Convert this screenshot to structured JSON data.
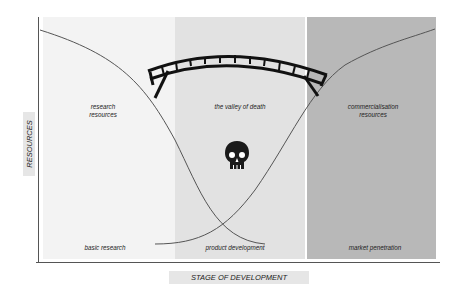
{
  "diagram": {
    "title": "Valley of death",
    "axes": {
      "x_label": "STAGE OF DEVELOPMENT",
      "y_label": "RESOURCES"
    },
    "panels": [
      {
        "name": "left",
        "top_label": "research\nresources",
        "top_label_lines": [
          "research",
          "resources"
        ],
        "bottom_label": "basic research",
        "color": "#f3f3f3"
      },
      {
        "name": "middle",
        "top_label": "the valley of death",
        "bottom_label": "product development",
        "color": "#e2e2e2"
      },
      {
        "name": "right",
        "top_label": "commercialisation\nresources",
        "top_label_lines": [
          "commercialisation",
          "resources"
        ],
        "bottom_label": "market penetration",
        "color": "#b8b8b8"
      }
    ],
    "curves": [
      {
        "name": "research-resources-curve",
        "direction": "decreasing"
      },
      {
        "name": "commercialisation-resources-curve",
        "direction": "increasing"
      }
    ],
    "icons": {
      "bridge": "bridge-icon",
      "skull": "skull-icon"
    }
  }
}
